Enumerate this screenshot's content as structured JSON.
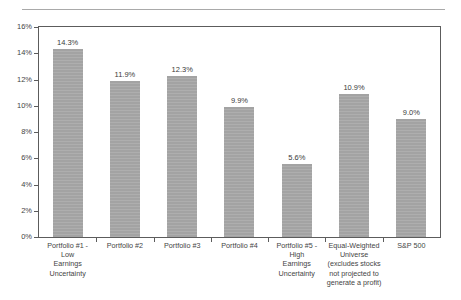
{
  "chart_data": {
    "type": "bar",
    "title": "",
    "subtitle": "",
    "xlabel": "",
    "ylabel": "",
    "ylim": [
      0,
      16
    ],
    "ytick_labels": [
      "16%",
      "14%",
      "12%",
      "10%",
      "8%",
      "6%",
      "4%",
      "2%",
      "0%"
    ],
    "ytick_values": [
      16,
      14,
      12,
      10,
      8,
      6,
      4,
      2,
      0
    ],
    "grid": false,
    "legend": false,
    "bar_color": "#a9a9a9",
    "categories": [
      "Portfolio #1 - Low Earnings Uncertainty",
      "Portfolio #2",
      "Portfolio #3",
      "Portfolio #4",
      "Portfolio #5 - High Earnings Uncertainty",
      "Equal-Weighted Universe (excludes stocks not projected to generate a profit)",
      "S&P 500"
    ],
    "category_lines": [
      [
        "Portfolio #1 -",
        "Low",
        "Earnings",
        "Uncertainty"
      ],
      [
        "Portfolio #2"
      ],
      [
        "Portfolio #3"
      ],
      [
        "Portfolio #4"
      ],
      [
        "Portfolio #5 -",
        "High",
        "Earnings",
        "Uncertainty"
      ],
      [
        "Equal-Weighted",
        "Universe",
        "(excludes stocks",
        "not projected to",
        "generate a profit)"
      ],
      [
        "S&P 500"
      ]
    ],
    "values": [
      14.3,
      11.9,
      12.3,
      9.9,
      5.6,
      10.9,
      9.0
    ],
    "value_labels": [
      "14.3%",
      "11.9%",
      "12.3%",
      "9.9%",
      "5.6%",
      "10.9%",
      "9.0%"
    ]
  }
}
